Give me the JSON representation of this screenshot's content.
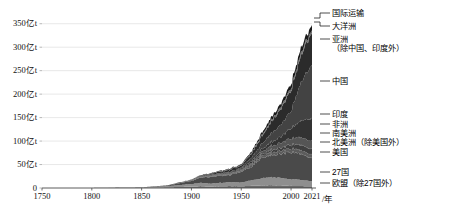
{
  "chart_data": {
    "type": "area",
    "title": "",
    "subtitle": "",
    "xlabel": "/年",
    "ylabel": "",
    "unit": "亿t",
    "stacked": true,
    "grid": true,
    "legend_position": "right-outside",
    "xlim": [
      1750,
      2021
    ],
    "ylim": [
      0,
      375
    ],
    "x_ticks": [
      "1750",
      "1800",
      "1850",
      "1900",
      "1950",
      "2000",
      "2021"
    ],
    "x_tick_values": [
      1750,
      1800,
      1850,
      1900,
      1950,
      2000,
      2021
    ],
    "y_ticks": [
      "0",
      "50亿t",
      "100亿t",
      "150亿t",
      "200亿t",
      "250亿t",
      "300亿t",
      "350亿t"
    ],
    "y_tick_values": [
      0,
      50,
      100,
      150,
      200,
      250,
      300,
      350
    ],
    "x": [
      1750,
      1800,
      1850,
      1875,
      1900,
      1910,
      1920,
      1930,
      1940,
      1950,
      1960,
      1970,
      1980,
      1990,
      2000,
      2010,
      2021
    ],
    "series": [
      {
        "name": "欧盟（除27国外）",
        "color": "#6a6a6a",
        "values": [
          0.0,
          0.1,
          0.6,
          1.4,
          3.0,
          3.8,
          3.2,
          3.6,
          4.0,
          3.8,
          4.6,
          5.4,
          6.0,
          5.6,
          4.4,
          4.2,
          3.6
        ]
      },
      {
        "name": "27国",
        "color": "#8e8e8e",
        "values": [
          0.0,
          0.1,
          0.7,
          2.2,
          5.4,
          7.0,
          6.0,
          7.4,
          8.2,
          8.0,
          11.5,
          15.0,
          17.0,
          16.0,
          14.0,
          13.0,
          10.5
        ]
      },
      {
        "name": "美国",
        "color": "#4a4a4a",
        "values": [
          0.0,
          0.0,
          0.2,
          1.2,
          6.6,
          11.5,
          14.5,
          15.0,
          15.5,
          23.0,
          28.5,
          44.0,
          47.5,
          50.0,
          58.5,
          54.0,
          47.5
        ]
      },
      {
        "name": "北美洲（除美国外）",
        "color": "#5c5c5c",
        "values": [
          0.0,
          0.0,
          0.0,
          0.1,
          0.4,
          0.8,
          1.2,
          1.4,
          1.5,
          2.2,
          3.0,
          4.4,
          6.0,
          6.6,
          7.4,
          8.0,
          7.8
        ]
      },
      {
        "name": "南美洲",
        "color": "#3f3f3f",
        "values": [
          0.0,
          0.0,
          0.0,
          0.0,
          0.2,
          0.4,
          0.6,
          0.8,
          0.9,
          1.2,
          2.0,
          3.2,
          5.4,
          6.4,
          8.6,
          11.0,
          11.5
        ]
      },
      {
        "name": "非洲",
        "color": "#555555",
        "values": [
          0.0,
          0.0,
          0.0,
          0.1,
          0.3,
          0.6,
          0.9,
          1.2,
          1.5,
          2.0,
          3.2,
          5.0,
          8.0,
          10.5,
          13.0,
          16.0,
          17.5
        ]
      },
      {
        "name": "印度",
        "color": "#333333",
        "values": [
          0.0,
          0.0,
          0.0,
          0.2,
          0.6,
          1.0,
          1.4,
          1.6,
          1.8,
          2.0,
          3.2,
          4.8,
          8.0,
          13.5,
          22.0,
          36.0,
          48.0
        ]
      },
      {
        "name": "中国",
        "color": "#434343",
        "values": [
          0.0,
          0.0,
          0.0,
          0.1,
          0.3,
          0.5,
          0.8,
          1.0,
          1.6,
          2.0,
          8.0,
          11.0,
          18.5,
          26.0,
          36.5,
          85.0,
          115.0
        ]
      },
      {
        "name": "亚洲（除中国、印度外）",
        "color": "#2b2b2b",
        "values": [
          0.0,
          0.0,
          0.0,
          0.1,
          0.6,
          1.2,
          2.0,
          3.0,
          4.6,
          4.0,
          8.0,
          16.0,
          24.0,
          34.0,
          44.0,
          58.0,
          68.0
        ]
      },
      {
        "name": "大洋洲",
        "color": "#707070",
        "values": [
          0.0,
          0.0,
          0.0,
          0.1,
          0.3,
          0.5,
          0.7,
          0.9,
          1.0,
          1.2,
          1.8,
          2.6,
          3.4,
          4.2,
          5.0,
          5.6,
          5.2
        ]
      },
      {
        "name": "国际运输",
        "color": "#1a1a1a",
        "values": [
          0.0,
          0.0,
          0.0,
          0.1,
          0.3,
          0.6,
          0.9,
          1.2,
          1.4,
          1.6,
          2.6,
          4.4,
          6.0,
          7.2,
          9.0,
          11.0,
          11.0
        ]
      }
    ],
    "annotations": []
  },
  "axes": {
    "y_ticks": [
      {
        "label": "350亿t",
        "value": 350
      },
      {
        "label": "300亿t",
        "value": 300
      },
      {
        "label": "250亿t",
        "value": 250
      },
      {
        "label": "200亿t",
        "value": 200
      },
      {
        "label": "150亿t",
        "value": 150
      },
      {
        "label": "100亿t",
        "value": 100
      },
      {
        "label": "50亿t",
        "value": 50
      },
      {
        "label": "0",
        "value": 0
      }
    ],
    "x_ticks": [
      {
        "label": "1750",
        "value": 1750
      },
      {
        "label": "1800",
        "value": 1800
      },
      {
        "label": "1850",
        "value": 1850
      },
      {
        "label": "1900",
        "value": 1900
      },
      {
        "label": "1950",
        "value": 1950
      },
      {
        "label": "2000",
        "value": 2000
      },
      {
        "label": "2021",
        "value": 2021
      }
    ],
    "x_axis_unit": "/年"
  },
  "legend": {
    "items": [
      {
        "label": "国际运输",
        "sub": "",
        "top": 13
      },
      {
        "label": "大洋洲",
        "sub": "",
        "top": 26
      },
      {
        "label": "亚洲",
        "sub": "（除中国、印度外）",
        "top": 39
      },
      {
        "label": "中国",
        "sub": "",
        "top": 81
      },
      {
        "label": "印度",
        "sub": "",
        "top": 114
      },
      {
        "label": "非洲",
        "sub": "",
        "top": 124
      },
      {
        "label": "南美洲",
        "sub": "",
        "top": 133
      },
      {
        "label": "北美洲（除美国外）",
        "sub": "",
        "top": 142
      },
      {
        "label": "美国",
        "sub": "",
        "top": 152
      },
      {
        "label": "27国",
        "sub": "",
        "top": 172
      },
      {
        "label": "欧盟（除27国外）",
        "sub": "",
        "top": 183
      }
    ]
  }
}
